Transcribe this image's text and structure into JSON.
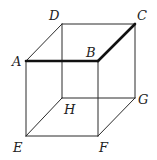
{
  "diagram": {
    "type": "cube",
    "vertices": [
      "A",
      "B",
      "C",
      "D",
      "E",
      "F",
      "G",
      "H"
    ],
    "edges": [
      {
        "from": "A",
        "to": "B",
        "emphasis": true
      },
      {
        "from": "B",
        "to": "C",
        "emphasis": true
      },
      {
        "from": "D",
        "to": "C",
        "emphasis": false
      },
      {
        "from": "A",
        "to": "D",
        "emphasis": false
      },
      {
        "from": "A",
        "to": "E",
        "emphasis": false
      },
      {
        "from": "B",
        "to": "F",
        "emphasis": false
      },
      {
        "from": "C",
        "to": "G",
        "emphasis": false
      },
      {
        "from": "D",
        "to": "H",
        "emphasis": false
      },
      {
        "from": "E",
        "to": "F",
        "emphasis": false
      },
      {
        "from": "H",
        "to": "G",
        "emphasis": false
      },
      {
        "from": "E",
        "to": "H",
        "emphasis": false
      },
      {
        "from": "F",
        "to": "G",
        "emphasis": false
      }
    ],
    "labels": {
      "A": "A",
      "B": "B",
      "C": "C",
      "D": "D",
      "E": "E",
      "F": "F",
      "G": "G",
      "H": "H"
    },
    "colors": {
      "line": "#2a2a2a",
      "emphasis_line": "#111111",
      "label": "#222222"
    }
  }
}
